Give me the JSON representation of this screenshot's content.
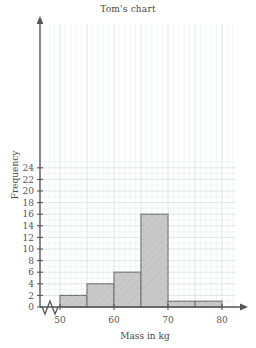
{
  "chart_data": {
    "type": "bar",
    "title": "Tom's chart",
    "xlabel": "Mass in kg",
    "ylabel": "Frequency",
    "categories": [
      "50-55",
      "55-60",
      "60-65",
      "65-70",
      "70-75",
      "75-80"
    ],
    "bin_edges": [
      50,
      55,
      60,
      65,
      70,
      75,
      80
    ],
    "values": [
      2,
      4,
      6,
      16,
      1,
      1
    ],
    "xlim": [
      50,
      80
    ],
    "ylim": [
      0,
      24
    ],
    "xticks": [
      50,
      60,
      70,
      80
    ],
    "yticks": [
      0,
      2,
      4,
      6,
      8,
      10,
      12,
      14,
      16,
      18,
      20,
      22,
      24
    ],
    "xtick_labels": [
      "50",
      "60",
      "70",
      "80"
    ],
    "ytick_labels": [
      "0",
      "2",
      "4",
      "6",
      "8",
      "10",
      "12",
      "14",
      "16",
      "18",
      "20",
      "22",
      "24"
    ],
    "grid": true,
    "grid_major_step_x": 5,
    "grid_minor_step_x": 1,
    "grid_major_step_y": 2,
    "grid_minor_step_y": 1,
    "legend": null,
    "axis_break_x": true,
    "bar_fill_color": "#c9c9c9",
    "bar_edge_color": "#6f6f6f",
    "grid_color": "#e9ecef",
    "axis_color": "#555555",
    "title_color": "#4a4a4a",
    "background_color": "#ffffff"
  }
}
